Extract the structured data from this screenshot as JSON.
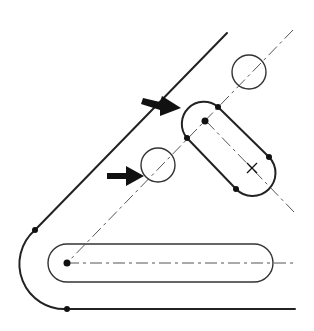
{
  "figure": {
    "colors": {
      "stroke": "#222222",
      "centerline": "#555555",
      "background": "#ffffff"
    },
    "elements": {
      "outline": "plate-edge-with-tangent-arc",
      "horizontal_slot": "slot-horizontal",
      "angled_slot": "slot-angled",
      "circles": [
        "reference-circle-upper",
        "reference-circle-lower"
      ],
      "arrows": [
        "arrow-upper",
        "arrow-lower"
      ],
      "centerlines": [
        "centerline-diagonal",
        "centerline-horizontal",
        "centerline-slot-axis"
      ]
    }
  }
}
